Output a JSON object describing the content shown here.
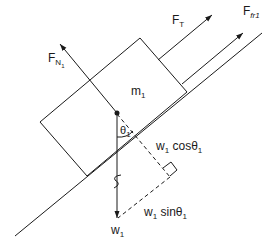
{
  "diagram": {
    "colors": {
      "line": "#1a1a1a",
      "background": "#ffffff"
    },
    "block": {
      "label": "m",
      "sub": "1"
    },
    "forces": {
      "normal": {
        "label": "F",
        "sub": "N",
        "subsub": "1"
      },
      "tension": {
        "label": "F",
        "sub": "T"
      },
      "friction": {
        "label": "F",
        "sub": "fr1"
      },
      "weight": {
        "label": "w",
        "sub": "1"
      },
      "weight_cos": {
        "label": "w",
        "sub": "1",
        "suffix": " cosθ",
        "suffix_sub": "1"
      },
      "weight_sin": {
        "label": "w",
        "sub": "1",
        "suffix": " sinθ",
        "suffix_sub": "1"
      }
    },
    "angle": {
      "label": "θ",
      "sub": "1"
    }
  }
}
